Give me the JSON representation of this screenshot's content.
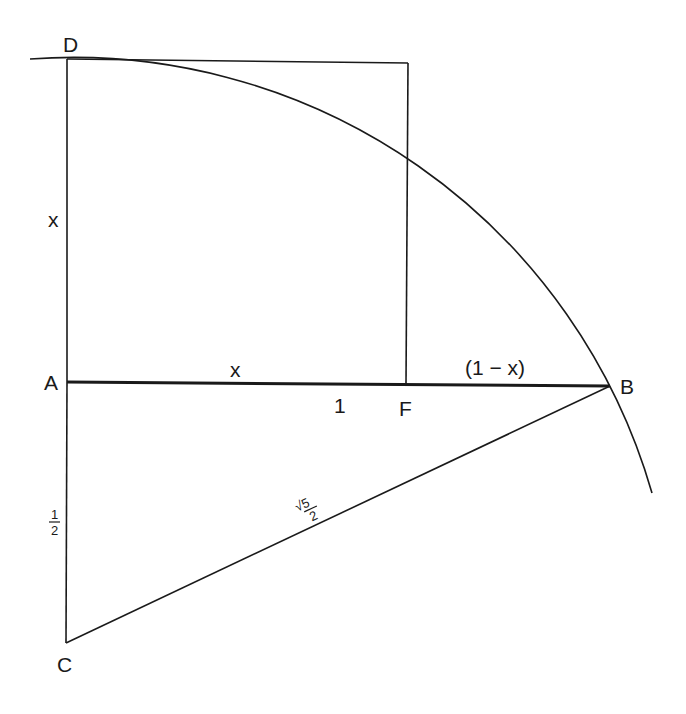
{
  "diagram": {
    "type": "golden-section-construction",
    "colors": {
      "ink": "#1a1a1a",
      "background": "#ffffff"
    },
    "points": {
      "D": {
        "label": "D"
      },
      "A": {
        "label": "A"
      },
      "F": {
        "label": "F"
      },
      "B": {
        "label": "B"
      },
      "C": {
        "label": "C"
      }
    },
    "segment_labels": {
      "AD": "x",
      "AF": "x",
      "AB": "1",
      "FB": "(1 − x)",
      "AC_num": "1",
      "AC_den": "2",
      "CB_num": "√5",
      "CB_den": "2"
    },
    "elements": [
      "square with side x on AF (top-left D)",
      "segment AB of length 1",
      "segment AC of length 1/2",
      "hypotenuse CB of length √5/2",
      "arc centered at C through B and D"
    ]
  }
}
